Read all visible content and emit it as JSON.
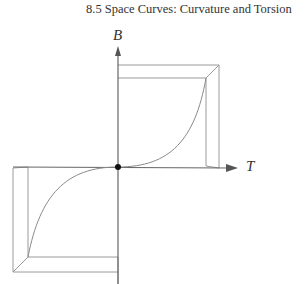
{
  "header": {
    "running_title": "8.5  Space Curves: Curvature and Torsion"
  },
  "figure": {
    "axes": {
      "vertical_label": "B",
      "horizontal_label": "T"
    },
    "colors": {
      "line": "#9a9a9a",
      "axis": "#666666",
      "curve": "#8a8a8a",
      "point": "#111111"
    }
  }
}
